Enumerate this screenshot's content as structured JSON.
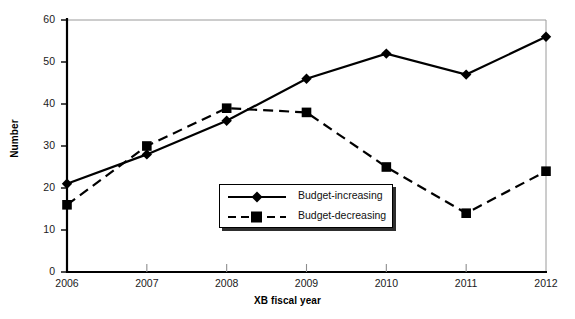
{
  "chart_data": {
    "type": "line",
    "title": "",
    "xlabel": "XB fiscal year",
    "ylabel": "Number",
    "categories": [
      "2006",
      "2007",
      "2008",
      "2009",
      "2010",
      "2011",
      "2012"
    ],
    "ylim": [
      0,
      60
    ],
    "yticks": [
      0,
      10,
      20,
      30,
      40,
      50,
      60
    ],
    "ytick_labels": [
      "0",
      "10",
      "20",
      "30",
      "40",
      "50",
      "60"
    ],
    "grid": false,
    "legend_position": "center",
    "series": [
      {
        "name": "Budget-increasing",
        "marker": "diamond",
        "linestyle": "solid",
        "color": "#000000",
        "values": [
          21,
          28,
          36,
          46,
          52,
          47,
          56
        ]
      },
      {
        "name": "Budget-decreasing",
        "marker": "square",
        "linestyle": "dashed",
        "color": "#000000",
        "values": [
          16,
          30,
          39,
          38,
          25,
          14,
          24
        ]
      }
    ]
  },
  "axes": {
    "x_title": "XB fiscal year",
    "y_title": "Number"
  },
  "legend": {
    "items": [
      {
        "label": "Budget-increasing",
        "marker": "diamond-marker-icon",
        "line": "solid-line-icon"
      },
      {
        "label": "Budget-decreasing",
        "marker": "square-marker-icon",
        "line": "dashed-line-icon"
      }
    ]
  },
  "colors": {
    "line": "#000000",
    "frame": "#9a9a9a",
    "axis": "#000000",
    "text": "#1a1a1a"
  }
}
